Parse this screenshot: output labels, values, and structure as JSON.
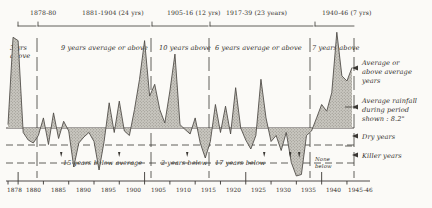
{
  "chart_data": {
    "type": "area",
    "title": "",
    "xlabel": "",
    "ylabel": "",
    "average_rainfall_inches": "8.2",
    "xlim": [
      1878,
      1946
    ],
    "ylim": [
      -3.6,
      6.2
    ],
    "baseline_value": 0,
    "grid": false,
    "axis_tick_labels": [
      "1878",
      "1880",
      "1885",
      "1890",
      "1895",
      "1900",
      "1905",
      "1910",
      "1915",
      "1920",
      "1925",
      "1930",
      "1935",
      "1940",
      "1945-46"
    ],
    "axis_tick_years": [
      1878,
      1880,
      1885,
      1890,
      1895,
      1900,
      1905,
      1910,
      1915,
      1920,
      1925,
      1930,
      1935,
      1940,
      1945
    ],
    "dry_threshold": -1.6,
    "killer_threshold": -2.6,
    "x": [
      1878,
      1879,
      1880,
      1881,
      1882,
      1883,
      1884,
      1885,
      1886,
      1887,
      1888,
      1889,
      1890,
      1891,
      1892,
      1893,
      1894,
      1895,
      1896,
      1897,
      1898,
      1899,
      1900,
      1901,
      1902,
      1903,
      1904,
      1905,
      1906,
      1907,
      1908,
      1909,
      1910,
      1911,
      1912,
      1913,
      1914,
      1915,
      1916,
      1917,
      1918,
      1919,
      1920,
      1921,
      1922,
      1923,
      1924,
      1925,
      1926,
      1927,
      1928,
      1929,
      1930,
      1931,
      1932,
      1933,
      1934,
      1935,
      1936,
      1937,
      1938,
      1939,
      1940,
      1941,
      1942,
      1943,
      1944,
      1945,
      1946
    ],
    "values": [
      0.2,
      5.4,
      5.2,
      -0.3,
      -0.8,
      -1.0,
      -0.5,
      0.6,
      -1.1,
      0.9,
      -0.7,
      0.4,
      -0.2,
      -2.6,
      -1.0,
      -0.6,
      -0.3,
      -0.9,
      -2.8,
      -0.9,
      1.5,
      -0.3,
      1.6,
      -0.2,
      -0.5,
      1.1,
      2.9,
      5.2,
      1.9,
      2.6,
      1.1,
      0.3,
      2.2,
      4.4,
      0.2,
      -0.1,
      -0.4,
      0.6,
      -1.0,
      -2.0,
      -0.9,
      1.4,
      -0.3,
      1.3,
      -0.4,
      2.4,
      0.0,
      -0.8,
      -1.4,
      -0.5,
      2.9,
      0.6,
      -0.9,
      -0.5,
      -1.5,
      -0.3,
      -2.3,
      -3.2,
      -3.1,
      -0.5,
      -0.2,
      0.6,
      1.4,
      1.0,
      2.1,
      5.7,
      3.1,
      2.8,
      3.6
    ],
    "periods": [
      {
        "id": "p1",
        "label": "1878-80",
        "band_label": "3 yrs\nabove",
        "below_label": "",
        "start": 1878,
        "end": 1880
      },
      {
        "id": "p2",
        "label": "1881-1904 (24 yrs)",
        "band_label": "9 years average or above",
        "below_label": "15 years below average",
        "start": 1881,
        "end": 1904
      },
      {
        "id": "p3",
        "label": "1905-16 (12 yrs)",
        "band_label": "10 years above",
        "below_label": "2 years below",
        "start": 1905,
        "end": 1916
      },
      {
        "id": "p4",
        "label": "1917-39  (23 years)",
        "band_label": "6 years average or above",
        "below_label": "17 years below",
        "start": 1917,
        "end": 1939
      },
      {
        "id": "p5",
        "label": "1940-46 (7 yrs)",
        "band_label": "7 years above",
        "below_label": "None\nbelow",
        "start": 1940,
        "end": 1946
      }
    ]
  },
  "bands": {
    "b1_line1": "3 yrs",
    "b1_line2": "above",
    "b2": "9 years average or above",
    "b3": "10 years above",
    "b4": "6 years average or above",
    "b5": "7 years above"
  },
  "period_labels": {
    "p1": "1878-80",
    "p2": "1881-1904 (24 yrs)",
    "p3": "1905-16 (12 yrs)",
    "p4": "1917-39  (23 years)",
    "p5": "1940-46 (7 yrs)"
  },
  "below_labels": {
    "p2": "15 years below average",
    "p3": "2 years below",
    "p4": "17 years below",
    "p5_line1": "None",
    "p5_line2": "below"
  },
  "legend": {
    "above": {
      "line1": "Average or",
      "line2": "above average",
      "line3": "years",
      "marker": "left-arrow-icon"
    },
    "average": {
      "line1": "Average rainfall",
      "line2": "during period",
      "line3": "shown : 8.2\"",
      "marker": "left-arrow-icon"
    },
    "dry": {
      "line1": "Dry years",
      "marker": "left-arrow-icon"
    },
    "killer": {
      "line1": "Killer years",
      "marker": "left-arrow-icon"
    }
  },
  "axis": {
    "ticks": [
      "1878",
      "1880",
      "1885",
      "1890",
      "1895",
      "1900",
      "1905",
      "1910",
      "1915",
      "1920",
      "1925",
      "1930",
      "1935",
      "1940",
      "1945-46"
    ]
  },
  "colors": {
    "ink": "#2b2b2b",
    "fill": "#b7b5ae",
    "paper": "#fbfaf7"
  }
}
